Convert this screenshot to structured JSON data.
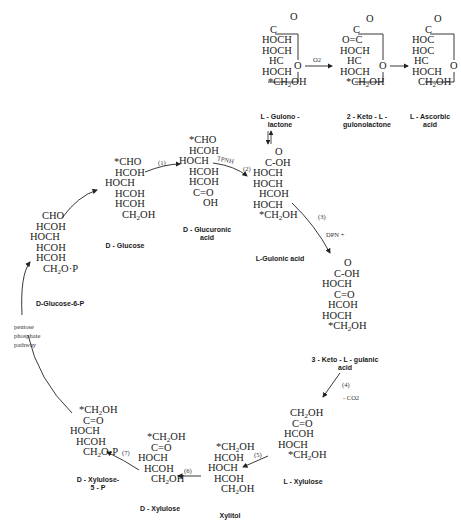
{
  "diagram": {
    "molecules": {
      "gulonolactone": {
        "name": "L - Gulono -\nlactone",
        "rows": [
          "C",
          "HOCH",
          "HOCH",
          "HC",
          "HOCH",
          "*CH2OH"
        ],
        "ring_o": "O",
        "carbonyl": "O"
      },
      "ketogulonolactone": {
        "name": "2 - Keto - L -\ngulonolactone",
        "rows": [
          "C",
          "O=C",
          "HOCH",
          "HC",
          "HOCH",
          "*CH2OH"
        ],
        "ring_o": "O",
        "carbonyl": "O"
      },
      "ascorbic": {
        "name": "L - Ascorbic\nacid",
        "rows": [
          "C",
          "HOC",
          "HOC",
          "HC",
          "HOCH",
          "CH2OH"
        ],
        "ring_o": "O",
        "carbonyl": "O"
      },
      "glucose": {
        "name": "D - Glucose",
        "rows": [
          "*CHO",
          "HCOH",
          "HOCH",
          "HCOH",
          "HCOH",
          "CH2OH"
        ]
      },
      "glucuronic": {
        "name": "D - Glucuronic\nacid",
        "rows": [
          "*CHO",
          "HCOH",
          "HOCH",
          "HCOH",
          "HCOH",
          "C=O",
          "OH"
        ]
      },
      "gulonic": {
        "name": "L-Gulonic acid",
        "rows": [
          "O",
          "C-OH",
          "HOCH",
          "HOCH",
          "HCOH",
          "HOCH",
          "*CH2OH"
        ]
      },
      "glucose6p": {
        "name": "D-Glucose-6-P",
        "rows": [
          "CHO",
          "HCOH",
          "HOCH",
          "HCOH",
          "HCOH",
          "CH2O·P"
        ]
      },
      "ketogulonic": {
        "name": "3 - Keto - L - gulanic\nacid",
        "rows": [
          "O",
          "C-OH",
          "HOCH",
          "C=O",
          "HCOH",
          "HOCH",
          "*CH2OH"
        ]
      },
      "lxylulose": {
        "name": "L - Xylulose",
        "rows": [
          "CH2OH",
          "C=O",
          "HCOH",
          "HOCH",
          "*CH2OH"
        ]
      },
      "xylitol": {
        "name": "Xylitol",
        "rows": [
          "*CH2OH",
          "HCOH",
          "HOCH",
          "HCOH",
          "CH2OH"
        ]
      },
      "dxylulose": {
        "name": "D - Xylulose",
        "rows": [
          "*CH2OH",
          "C=O",
          "HOCH",
          "HCOH",
          "CH2OH"
        ]
      },
      "xylulose5p": {
        "name": "D - Xylulose-\n5 - P",
        "rows": [
          "*CH2OH",
          "C=O",
          "HOCH",
          "HCOH",
          "CH2O·P"
        ]
      }
    },
    "labels": {
      "o2": "O2",
      "step1": "(1)",
      "tpnh": "TPNH",
      "step2": "(2)",
      "step3": "(3)",
      "dpn": "DPN +",
      "step4": "(4)",
      "co2": "- CO2",
      "step5": "(5)",
      "step6": "(6)",
      "step7": "(7)",
      "pentose": "pentose",
      "phosphate": "phosphate",
      "pathway": "pathway"
    }
  }
}
